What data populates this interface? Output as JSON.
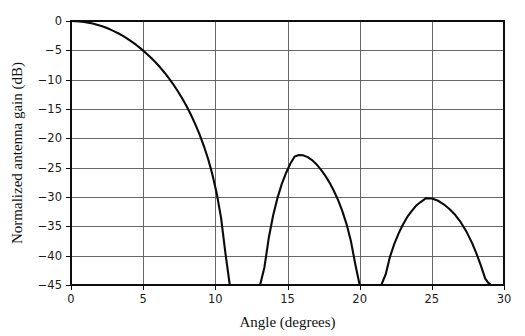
{
  "chart_data": {
    "type": "line",
    "title": "",
    "subtitle": "",
    "xlabel": "Angle (degrees)",
    "ylabel": "Normalized antenna gain (dB)",
    "xlim": [
      0,
      30
    ],
    "ylim": [
      -45,
      0
    ],
    "grid": true,
    "legend": null,
    "x_ticks": [
      0,
      5,
      10,
      15,
      20,
      25,
      30
    ],
    "x_tick_labels": [
      "0",
      "5",
      "10",
      "15",
      "20",
      "25",
      "30"
    ],
    "y_ticks": [
      0,
      -5,
      -10,
      -15,
      -20,
      -25,
      -30,
      -35,
      -40,
      -45
    ],
    "y_tick_labels": [
      "0",
      "−5",
      "−10",
      "−15",
      "−20",
      "−25",
      "−30",
      "−35",
      "−40",
      "−45"
    ],
    "line_color": "#0a0a0a",
    "grid_color": "#55595c",
    "frame_color": "#0d0d0d",
    "background_color": "#ffffff",
    "annotations": [],
    "features": {
      "main_beam_peak_deg": 0,
      "main_beam_peak_db": 0,
      "first_null_deg": 12.1,
      "second_null_deg": 20.6,
      "third_null_deg": 29.1,
      "sidelobe_1_peak_deg": 15.5,
      "sidelobe_1_peak_db": -22.8,
      "sidelobe_2_peak_deg": 24.6,
      "sidelobe_2_peak_db": -30.2
    },
    "series": [
      {
        "name": "Normalized antenna gain",
        "x": [
          0.0,
          0.3,
          0.6,
          0.9,
          1.2,
          1.5,
          1.8,
          2.1,
          2.4,
          2.7,
          3.0,
          3.3,
          3.6,
          3.9,
          4.2,
          4.5,
          4.8,
          5.0,
          5.3,
          5.6,
          5.9,
          6.2,
          6.5,
          6.8,
          7.1,
          7.4,
          7.7,
          8.0,
          8.3,
          8.6,
          8.9,
          9.2,
          9.5,
          9.8,
          10.1,
          10.4,
          10.7,
          11.0,
          11.2,
          11.4,
          11.6,
          11.8,
          11.95,
          12.05,
          12.1,
          12.2,
          12.35,
          12.5,
          12.7,
          12.9,
          13.1,
          13.4,
          13.7,
          14.0,
          14.3,
          14.6,
          14.9,
          15.2,
          15.5,
          15.8,
          16.1,
          16.4,
          16.7,
          17.0,
          17.3,
          17.6,
          17.9,
          18.2,
          18.5,
          18.8,
          19.1,
          19.4,
          19.7,
          20.0,
          20.2,
          20.4,
          20.5,
          20.6,
          20.75,
          20.9,
          21.05,
          21.2,
          21.5,
          21.8,
          22.1,
          22.4,
          22.7,
          23.0,
          23.3,
          23.6,
          23.9,
          24.2,
          24.6,
          25.0,
          25.4,
          25.8,
          26.2,
          26.6,
          27.0,
          27.4,
          27.8,
          28.1,
          28.4,
          28.7,
          28.9,
          29.0,
          29.05,
          29.1
        ],
        "y": [
          0.0,
          -0.02,
          -0.07,
          -0.16,
          -0.28,
          -0.44,
          -0.63,
          -0.86,
          -1.12,
          -1.42,
          -1.76,
          -2.13,
          -2.55,
          -3.0,
          -3.5,
          -4.04,
          -4.63,
          -5.05,
          -5.7,
          -6.4,
          -7.16,
          -7.98,
          -8.86,
          -9.82,
          -10.85,
          -11.97,
          -13.18,
          -14.5,
          -15.94,
          -17.53,
          -19.29,
          -21.27,
          -23.53,
          -26.19,
          -29.43,
          -33.6,
          -39.6,
          -45.0,
          -45.0,
          -45.0,
          -45.0,
          -45.0,
          -45.0,
          -45.0,
          -45.0,
          -45.0,
          -45.0,
          -45.0,
          -45.0,
          -45.0,
          -45.0,
          -42.0,
          -37.0,
          -33.2,
          -30.2,
          -27.8,
          -25.9,
          -24.3,
          -23.1,
          -22.85,
          -22.9,
          -23.2,
          -23.7,
          -24.4,
          -25.3,
          -26.3,
          -27.5,
          -28.9,
          -30.5,
          -32.4,
          -34.7,
          -37.6,
          -41.5,
          -45.0,
          -45.0,
          -45.0,
          -45.0,
          -45.0,
          -45.0,
          -45.0,
          -45.0,
          -45.0,
          -45.0,
          -43.2,
          -40.2,
          -38.0,
          -36.2,
          -34.7,
          -33.4,
          -32.4,
          -31.5,
          -30.9,
          -30.2,
          -30.25,
          -30.6,
          -31.2,
          -32.0,
          -33.0,
          -34.3,
          -35.9,
          -37.9,
          -39.7,
          -41.7,
          -43.9,
          -44.6,
          -44.8,
          -44.9,
          -45.0
        ]
      }
    ]
  },
  "layout": {
    "plot_left": 71,
    "plot_right": 504,
    "plot_top": 21,
    "plot_bottom": 285
  }
}
